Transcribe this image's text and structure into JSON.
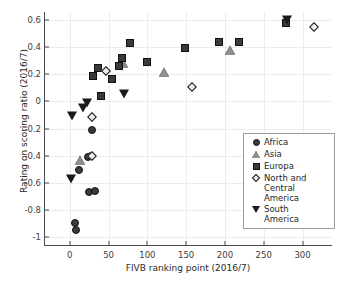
{
  "chart_data": {
    "type": "scatter",
    "title": "",
    "xlabel": "FIVB ranking point (2016/7)",
    "ylabel": "Rating on scoring ratio (2016/7)",
    "xlim": [
      -32,
      338
    ],
    "ylim": [
      -1.06,
      0.66
    ],
    "xticks": [
      0,
      50,
      100,
      150,
      200,
      250,
      300
    ],
    "xtick_labels": [
      "0",
      "50",
      "100",
      "150",
      "200",
      "250",
      "300"
    ],
    "yticks": [
      0.6,
      0.4,
      0.2,
      0,
      -0.2,
      -0.4,
      -0.6,
      -0.8,
      -1
    ],
    "ytick_labels": [
      "0.6",
      "0.4",
      "0.2",
      "0",
      "-0.2",
      "-0.4",
      "-0.6",
      "-0.8",
      "-1"
    ],
    "grid": true,
    "legend_position": "lower right",
    "series": [
      {
        "name": "Africa",
        "marker": "circle",
        "color": "#3a3a3a",
        "points": [
          {
            "x": 7,
            "y": -0.9
          },
          {
            "x": 8,
            "y": -0.95
          },
          {
            "x": 12,
            "y": -0.51
          },
          {
            "x": 25,
            "y": -0.67
          },
          {
            "x": 33,
            "y": -0.66
          },
          {
            "x": 24,
            "y": -0.41
          },
          {
            "x": 27,
            "y": -0.4
          },
          {
            "x": 28,
            "y": -0.21
          }
        ]
      },
      {
        "name": "Asia",
        "marker": "triangle-up",
        "color": "#8f8f8f",
        "points": [
          {
            "x": 13,
            "y": -0.43
          },
          {
            "x": 68,
            "y": 0.28
          },
          {
            "x": 121,
            "y": 0.215
          },
          {
            "x": 207,
            "y": 0.38
          }
        ]
      },
      {
        "name": "Europa",
        "marker": "square",
        "color": "#3a3a3a",
        "points": [
          {
            "x": 30,
            "y": 0.19
          },
          {
            "x": 36,
            "y": 0.25
          },
          {
            "x": 40,
            "y": 0.04
          },
          {
            "x": 54,
            "y": 0.165
          },
          {
            "x": 64,
            "y": 0.265
          },
          {
            "x": 67,
            "y": 0.32
          },
          {
            "x": 78,
            "y": 0.43
          },
          {
            "x": 100,
            "y": 0.29
          },
          {
            "x": 149,
            "y": 0.395
          },
          {
            "x": 192,
            "y": 0.44
          },
          {
            "x": 218,
            "y": 0.44
          },
          {
            "x": 279,
            "y": 0.58
          }
        ]
      },
      {
        "name": "North and Central America",
        "marker": "diamond",
        "color": "#ededed",
        "points": [
          {
            "x": 29,
            "y": -0.115
          },
          {
            "x": 29,
            "y": -0.4
          },
          {
            "x": 47,
            "y": 0.225
          },
          {
            "x": 158,
            "y": 0.11
          },
          {
            "x": 315,
            "y": 0.55
          }
        ]
      },
      {
        "name": "South America",
        "marker": "triangle-down",
        "color": "#1a1a1a",
        "points": [
          {
            "x": 2,
            "y": -0.575
          },
          {
            "x": 3,
            "y": -0.105
          },
          {
            "x": 17,
            "y": -0.045
          },
          {
            "x": 22,
            "y": -0.015
          },
          {
            "x": 70,
            "y": 0.055
          },
          {
            "x": 280,
            "y": 0.6
          }
        ]
      }
    ]
  },
  "legend": {
    "items": [
      {
        "label": "Africa",
        "marker": "circle"
      },
      {
        "label": "Asia",
        "marker": "triangle-up"
      },
      {
        "label": "Europa",
        "marker": "square"
      },
      {
        "label": "North and\nCentral\nAmerica",
        "marker": "diamond"
      },
      {
        "label": "South\nAmerica",
        "marker": "triangle-down"
      }
    ]
  }
}
